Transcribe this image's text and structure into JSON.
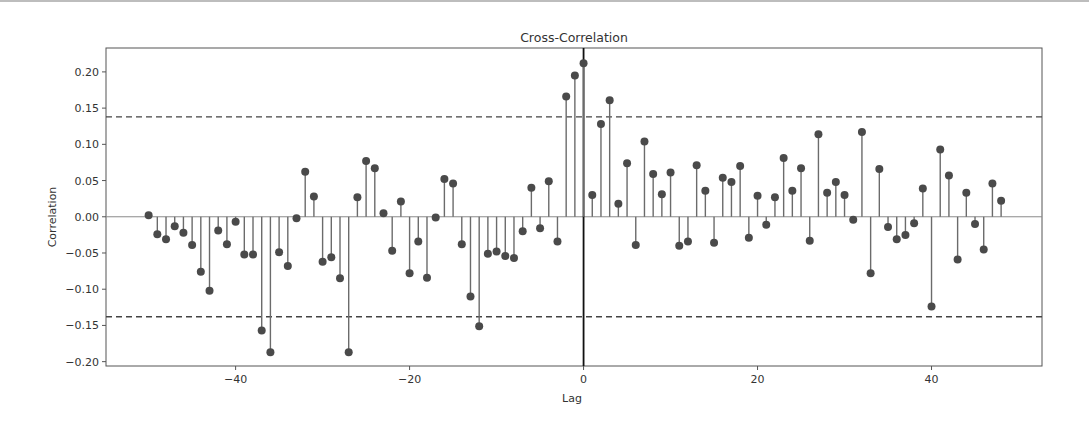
{
  "chart_data": {
    "type": "stem",
    "title": "Cross-Correlation",
    "xlabel": "Lag",
    "ylabel": "Correlation",
    "xlim": [
      -54.9,
      52.7
    ],
    "ylim": [
      -0.206,
      0.233
    ],
    "xticks": [
      -40,
      -20,
      0,
      20,
      40
    ],
    "xtick_labels": [
      "−40",
      "−20",
      "0",
      "20",
      "40"
    ],
    "yticks": [
      -0.2,
      -0.15,
      -0.1,
      -0.05,
      0.0,
      0.05,
      0.1,
      0.15,
      0.2
    ],
    "ytick_labels": [
      "−0.20",
      "−0.15",
      "−0.10",
      "−0.05",
      "0.00",
      "0.05",
      "0.10",
      "0.15",
      "0.20"
    ],
    "grid": false,
    "legend": null,
    "confidence_bounds": [
      0.138,
      -0.138
    ],
    "zero_line": true,
    "lag0_vertical_line": true,
    "x": [
      -50,
      -49,
      -48,
      -47,
      -46,
      -45,
      -44,
      -43,
      -42,
      -41,
      -40,
      -39,
      -38,
      -37,
      -36,
      -35,
      -34,
      -33,
      -32,
      -31,
      -30,
      -29,
      -28,
      -27,
      -26,
      -25,
      -24,
      -23,
      -22,
      -21,
      -20,
      -19,
      -18,
      -17,
      -16,
      -15,
      -14,
      -13,
      -12,
      -11,
      -10,
      -9,
      -8,
      -7,
      -6,
      -5,
      -4,
      -3,
      -2,
      -1,
      0,
      1,
      2,
      3,
      4,
      5,
      6,
      7,
      8,
      9,
      10,
      11,
      12,
      13,
      14,
      15,
      16,
      17,
      18,
      19,
      20,
      21,
      22,
      23,
      24,
      25,
      26,
      27,
      28,
      29,
      30,
      31,
      32,
      33,
      34,
      35,
      36,
      37,
      38,
      39,
      40,
      41,
      42,
      43,
      44,
      45,
      46,
      47,
      48
    ],
    "values": [
      0.002,
      -0.024,
      -0.031,
      -0.013,
      -0.022,
      -0.039,
      -0.076,
      -0.102,
      -0.019,
      -0.038,
      -0.007,
      -0.052,
      -0.052,
      -0.157,
      -0.187,
      -0.049,
      -0.068,
      -0.002,
      0.062,
      0.028,
      -0.062,
      -0.056,
      -0.085,
      -0.187,
      0.027,
      0.077,
      0.067,
      0.005,
      -0.047,
      0.021,
      -0.078,
      -0.034,
      -0.084,
      -0.001,
      0.052,
      0.046,
      -0.038,
      -0.11,
      -0.151,
      -0.051,
      -0.048,
      -0.054,
      -0.057,
      -0.02,
      0.04,
      -0.016,
      0.049,
      -0.034,
      0.166,
      0.195,
      0.212,
      0.03,
      0.128,
      0.161,
      0.018,
      0.074,
      -0.039,
      0.104,
      0.059,
      0.031,
      0.061,
      -0.04,
      -0.034,
      0.071,
      0.036,
      -0.036,
      0.054,
      0.048,
      0.07,
      -0.029,
      0.029,
      -0.011,
      0.027,
      0.081,
      0.036,
      0.067,
      -0.033,
      0.114,
      0.033,
      0.048,
      0.03,
      -0.004,
      0.117,
      -0.078,
      0.066,
      -0.014,
      -0.031,
      -0.025,
      -0.009,
      0.039,
      -0.124,
      0.093,
      0.057,
      -0.059,
      0.033,
      -0.01,
      -0.045,
      0.046,
      0.022
    ],
    "colors": {
      "stem": "#6b6b6b",
      "marker": "#4a4a4a",
      "confidence_line": "#444444",
      "zero_line": "#8a8a8a",
      "lag0_line": "#111111",
      "frame": "#555555"
    }
  }
}
